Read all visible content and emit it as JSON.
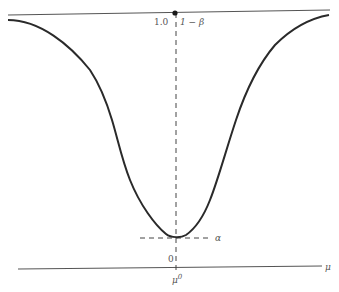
{
  "diagram": {
    "type": "power-function-curve",
    "labels": {
      "top_value": "1.0",
      "one_minus_beta": "1 − β",
      "alpha": "α",
      "zero": "0",
      "mu_zero": "μ",
      "mu_zero_sup": "0",
      "mu_axis": "μ"
    },
    "colors": {
      "curve": "#2a2a2a",
      "lines": "#555555",
      "dashed": "#444444",
      "text": "#555555",
      "background": "#ffffff"
    }
  }
}
